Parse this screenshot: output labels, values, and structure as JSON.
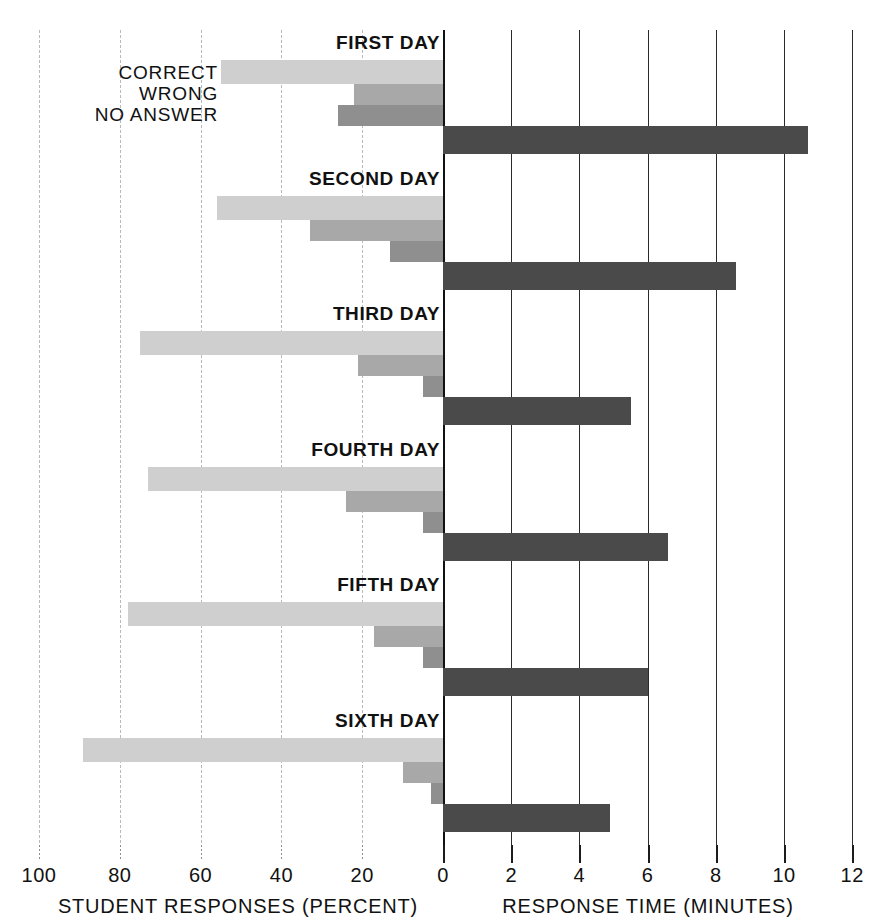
{
  "chart_data": {
    "type": "bar",
    "title": "",
    "orientation": "horizontal-bidirectional",
    "legend": [
      "CORRECT",
      "WRONG",
      "NO ANSWER"
    ],
    "legend_position": "upper-left-inside",
    "grid": true,
    "categories": [
      "FIRST DAY",
      "SECOND DAY",
      "THIRD DAY",
      "FOURTH DAY",
      "FIFTH DAY",
      "SIXTH DAY"
    ],
    "left_axis": {
      "label": "STUDENT RESPONSES (PERCENT)",
      "ticks": [
        100,
        80,
        60,
        40,
        20,
        0
      ],
      "tick_labels": [
        "100",
        "80",
        "60",
        "40",
        "20",
        "0"
      ],
      "range": [
        100,
        0
      ],
      "direction": "right-to-left"
    },
    "right_axis": {
      "label": "RESPONSE TIME (MINUTES)",
      "ticks": [
        0,
        2,
        4,
        6,
        8,
        10,
        12
      ],
      "tick_labels": [
        "0",
        "2",
        "4",
        "6",
        "8",
        "10",
        "12"
      ],
      "range": [
        0,
        12
      ],
      "direction": "left-to-right"
    },
    "series": [
      {
        "name": "CORRECT",
        "axis": "left",
        "color": "#cfcfcf",
        "values": [
          55,
          56,
          75,
          73,
          78,
          89
        ]
      },
      {
        "name": "WRONG",
        "axis": "left",
        "color": "#a8a8a8",
        "values": [
          22,
          33,
          21,
          24,
          17,
          10
        ]
      },
      {
        "name": "NO ANSWER",
        "axis": "left",
        "color": "#8f8f8f",
        "values": [
          26,
          13,
          5,
          5,
          5,
          3
        ]
      },
      {
        "name": "RESPONSE TIME",
        "axis": "right",
        "color": "#4a4a4a",
        "values": [
          10.7,
          8.6,
          5.5,
          6.6,
          6.0,
          4.9
        ]
      }
    ]
  },
  "colors": {
    "correct": "#cfcfcf",
    "wrong": "#a8a8a8",
    "no_answer": "#8f8f8f",
    "response_time": "#4a4a4a",
    "gridline_left": "#b9b9b9",
    "gridline_right": "#2a2a2a",
    "text": "#111111"
  }
}
